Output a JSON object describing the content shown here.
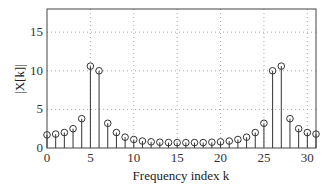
{
  "chart_data": {
    "type": "stem",
    "title": "",
    "xlabel": "Frequency index k",
    "ylabel": "|X[k]|",
    "xlim": [
      0,
      31
    ],
    "ylim": [
      0,
      18
    ],
    "xticks": [
      0,
      5,
      10,
      15,
      20,
      25,
      30
    ],
    "yticks": [
      0,
      5,
      10,
      15
    ],
    "grid": true,
    "x": [
      0,
      1,
      2,
      3,
      4,
      5,
      6,
      7,
      8,
      9,
      10,
      11,
      12,
      13,
      14,
      15,
      16,
      17,
      18,
      19,
      20,
      21,
      22,
      23,
      24,
      25,
      26,
      27,
      28,
      29,
      30,
      31
    ],
    "values": [
      1.7,
      1.8,
      2.0,
      2.5,
      3.8,
      10.6,
      10.0,
      3.2,
      2.0,
      1.4,
      1.1,
      0.9,
      0.8,
      0.75,
      0.7,
      0.7,
      0.7,
      0.7,
      0.7,
      0.75,
      0.8,
      0.9,
      1.1,
      1.4,
      2.0,
      3.2,
      10.0,
      10.6,
      3.8,
      2.5,
      2.0,
      1.8
    ]
  }
}
